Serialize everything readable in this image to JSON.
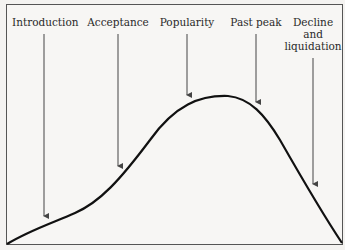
{
  "diagram": {
    "type": "product-life-cycle-curve",
    "stages": [
      {
        "label": "Introduction",
        "x": 44,
        "arrow_to_y": 216
      },
      {
        "label": "Acceptance",
        "x": 118,
        "arrow_to_y": 168
      },
      {
        "label": "Popularity",
        "x": 187,
        "arrow_to_y": 97
      },
      {
        "label": "Past peak",
        "x": 256,
        "arrow_to_y": 104
      },
      {
        "label": "Decline\nand\nliquidation",
        "x": 313,
        "arrow_to_y": 186
      }
    ],
    "colors": {
      "curve": "#111111",
      "arrow": "#444444",
      "frame": "#555555",
      "background": "#f7f6f4"
    }
  }
}
